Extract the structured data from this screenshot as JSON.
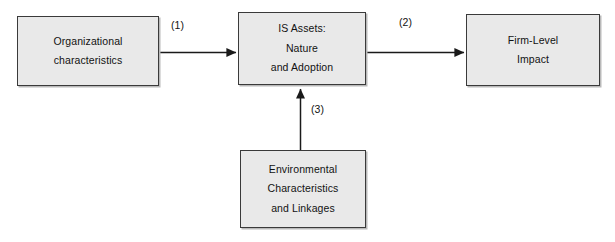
{
  "diagram": {
    "type": "flow-diagram",
    "nodes": [
      {
        "id": "organizational-characteristics",
        "lines": [
          "Organizational",
          "characteristics"
        ]
      },
      {
        "id": "is-assets",
        "lines": [
          "IS Assets:",
          "Nature",
          "and Adoption"
        ]
      },
      {
        "id": "firm-level-impact",
        "lines": [
          "Firm-Level",
          "Impact"
        ]
      },
      {
        "id": "environmental-characteristics",
        "lines": [
          "Environmental",
          "Characteristics",
          "and Linkages"
        ]
      }
    ],
    "edges": [
      {
        "id": "edge-1",
        "label": "(1)",
        "from": "organizational-characteristics",
        "to": "is-assets",
        "direction": "right"
      },
      {
        "id": "edge-2",
        "label": "(2)",
        "from": "is-assets",
        "to": "firm-level-impact",
        "direction": "right"
      },
      {
        "id": "edge-3",
        "label": "(3)",
        "from": "environmental-characteristics",
        "to": "is-assets",
        "direction": "up"
      }
    ],
    "colors": {
      "node_fill": "#e9e9e9",
      "node_border": "#3a3a3a",
      "edge_stroke": "#1a1a1a",
      "text": "#121212",
      "background": "#ffffff",
      "shadow": "#b9b9b9"
    }
  }
}
